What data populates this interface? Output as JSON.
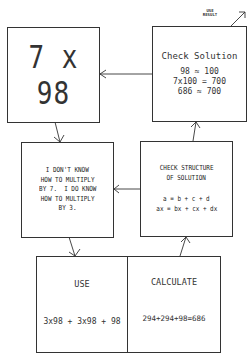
{
  "diagram": {
    "problem_box": {
      "text": "7 x 98"
    },
    "check_solution_box": {
      "title": "Check Solution",
      "lines": [
        "98 ≈ 100",
        "7x100 = 700",
        "686 ≈ 700"
      ]
    },
    "use_result_label": {
      "line1": "USE",
      "line2": "RESULT"
    },
    "knowledge_box": {
      "lines": [
        "I DON'T KNOW",
        "HOW TO MULTIPLY",
        "BY 7.  I DO KNOW",
        "HOW TO MULTIPLY",
        "BY 3."
      ]
    },
    "check_structure_box": {
      "title_lines": [
        "CHECK STRUCTURE",
        "OF SOLUTION"
      ],
      "eq_lines": [
        "a = b + c + d",
        "ax = bx + cx + dx"
      ]
    },
    "use_box": {
      "title": "USE",
      "equation": "3x98 + 3x98 + 98"
    },
    "calculate_box": {
      "title": "CALCULATE",
      "equation": "294+294+98=686"
    },
    "line_color": "#333333"
  }
}
